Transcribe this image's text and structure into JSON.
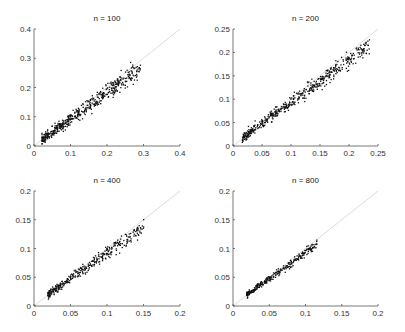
{
  "chart_data": [
    {
      "type": "scatter",
      "title": "n = 100",
      "xlabel": "",
      "ylabel": "",
      "xlim": [
        0,
        0.4
      ],
      "ylim": [
        0,
        0.4
      ],
      "xticks": [
        "0",
        "0.1",
        "0.2",
        "0.3",
        "0.4"
      ],
      "yticks": [
        "0",
        "0.1",
        "0.2",
        "0.3",
        "0.4"
      ],
      "reference_line": "y = x",
      "grid": false,
      "series": [
        {
          "name": "estimates",
          "x_range": [
            0.02,
            0.29
          ],
          "slope": 0.93,
          "spread": 0.012,
          "count": 500
        }
      ],
      "box": [
        34,
        29,
        180,
        146
      ]
    },
    {
      "type": "scatter",
      "title": "n = 200",
      "xlabel": "",
      "ylabel": "",
      "xlim": [
        0,
        0.25
      ],
      "ylim": [
        0,
        0.25
      ],
      "xticks": [
        "0",
        "0.05",
        "0.1",
        "0.15",
        "0.2",
        "0.25"
      ],
      "yticks": [
        "0",
        "0.05",
        "0.1",
        "0.15",
        "0.2",
        "0.25"
      ],
      "reference_line": "y = x",
      "grid": false,
      "series": [
        {
          "name": "estimates",
          "x_range": [
            0.015,
            0.235
          ],
          "slope": 0.93,
          "spread": 0.007,
          "count": 500
        }
      ],
      "box": [
        233,
        29,
        378,
        146
      ]
    },
    {
      "type": "scatter",
      "title": "n = 400",
      "xlabel": "",
      "ylabel": "",
      "xlim": [
        0,
        0.2
      ],
      "ylim": [
        0,
        0.2
      ],
      "xticks": [
        "0",
        "0.05",
        "0.1",
        "0.15",
        "0.2"
      ],
      "yticks": [
        "0",
        "0.05",
        "0.1",
        "0.15",
        "0.2"
      ],
      "reference_line": "y = x",
      "grid": false,
      "series": [
        {
          "name": "estimates",
          "x_range": [
            0.018,
            0.15
          ],
          "slope": 0.92,
          "spread": 0.005,
          "count": 350
        }
      ],
      "box": [
        34,
        191,
        180,
        306
      ]
    },
    {
      "type": "scatter",
      "title": "n = 800",
      "xlabel": "",
      "ylabel": "",
      "xlim": [
        0,
        0.2
      ],
      "ylim": [
        0,
        0.2
      ],
      "xticks": [
        "0",
        "0.05",
        "0.1",
        "0.15",
        "0.2"
      ],
      "yticks": [
        "0",
        "0.05",
        "0.1",
        "0.15",
        "0.2"
      ],
      "reference_line": "y = x",
      "grid": false,
      "series": [
        {
          "name": "estimates",
          "x_range": [
            0.018,
            0.115
          ],
          "slope": 0.94,
          "spread": 0.003,
          "count": 300
        }
      ],
      "box": [
        233,
        191,
        378,
        306
      ]
    }
  ],
  "colors": {
    "points": "#111111",
    "axes": "#555555",
    "reference_line": "#dddddd"
  }
}
